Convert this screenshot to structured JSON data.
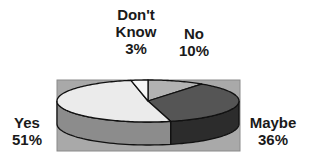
{
  "chart_data": {
    "type": "pie",
    "style": "3d",
    "title": "",
    "categories": [
      "No",
      "Maybe",
      "Yes",
      "Don't Know"
    ],
    "values": [
      10,
      36,
      51,
      3
    ],
    "value_labels": [
      "10%",
      "36%",
      "51%",
      "3%"
    ],
    "start_angle": "top",
    "direction": "clockwise",
    "colors": {
      "No": "#b2b2b2",
      "Maybe": "#555555",
      "Yes": "#ebebeb",
      "Don't Know": "#f6f6f6"
    },
    "side_colors": {
      "No": "#8a8a8a",
      "Maybe": "#2c2c2c",
      "Yes": "#8c8c8c",
      "Don't Know": "#c8c8c8"
    },
    "plot_background": "#a9a9a9",
    "legend": "none (direct labels)"
  },
  "labels": {
    "dontknow": {
      "line1": "Don't",
      "line2": "Know",
      "pct": "3%"
    },
    "no": {
      "name": "No",
      "pct": "10%"
    },
    "yes": {
      "name": "Yes",
      "pct": "51%"
    },
    "maybe": {
      "name": "Maybe",
      "pct": "36%"
    }
  }
}
